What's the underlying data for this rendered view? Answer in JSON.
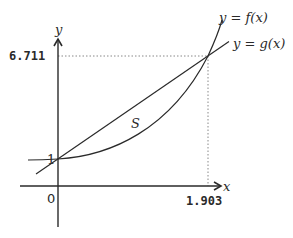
{
  "diagram": {
    "axes": {
      "x_label": "x",
      "y_label": "y",
      "origin_label": "0"
    },
    "tick_labels": {
      "y_intercept": "1",
      "y_intersection": "6.711",
      "x_intersection": "1.903"
    },
    "curves": [
      {
        "name": "f",
        "label": "y = f(x)",
        "kind": "exponential-like convex curve"
      },
      {
        "name": "g",
        "label": "y = g(x)",
        "kind": "straight line"
      }
    ],
    "region_label": "S",
    "points": [
      {
        "x": 0,
        "y": 1,
        "note": "curves meet on y-axis"
      },
      {
        "x": 1.903,
        "y": 6.711,
        "note": "curves intersect"
      }
    ],
    "colors": {
      "stroke": "#2a2a2a",
      "guide": "#888888",
      "background": "#ffffff"
    }
  }
}
